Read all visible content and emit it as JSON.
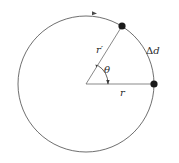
{
  "diagram": {
    "labels": {
      "r_prime": "r′",
      "theta": "θ",
      "delta_symbol": "Δ",
      "delta_var": "d",
      "r": "r"
    },
    "geometry": {
      "center": [
        86,
        84
      ],
      "radius": 68,
      "angle_deg": 58,
      "point_start": [
        154,
        84
      ],
      "point_end": [
        122,
        26
      ]
    },
    "colors": {
      "stroke": "#4a4a4a",
      "radius_line": "#8a8a8a",
      "point": "#1a1a1a",
      "text": "#2a2a2a"
    },
    "motion_direction": "clockwise-arrow-at-top"
  }
}
